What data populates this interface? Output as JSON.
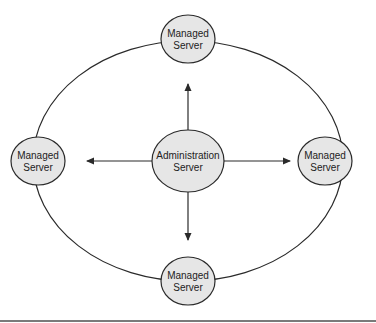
{
  "diagram": {
    "type": "hub-and-ring server topology",
    "colors": {
      "stroke": "#2a2a2a",
      "node_fill": "#e6e6e6",
      "background": "#ffffff",
      "rule": "#7a7a7a"
    },
    "ring": {
      "cx": 188,
      "cy": 161,
      "rx": 155,
      "ry": 120
    },
    "center_node": {
      "id": "admin",
      "line1": "Administration",
      "line2": "Server",
      "cx": 188,
      "cy": 161,
      "rx": 36,
      "ry": 31
    },
    "nodes": [
      {
        "id": "top",
        "line1": "Managed",
        "line2": "Server",
        "cx": 188,
        "cy": 39,
        "rx": 27,
        "ry": 24
      },
      {
        "id": "left",
        "line1": "Managed",
        "line2": "Server",
        "cx": 38,
        "cy": 161,
        "rx": 27,
        "ry": 24
      },
      {
        "id": "right",
        "line1": "Managed",
        "line2": "Server",
        "cx": 325,
        "cy": 161,
        "rx": 27,
        "ry": 24
      },
      {
        "id": "bottom",
        "line1": "Managed",
        "line2": "Server",
        "cx": 188,
        "cy": 281,
        "rx": 27,
        "ry": 24
      }
    ],
    "arrows": [
      {
        "from": "admin",
        "to": "top",
        "x1": 188,
        "y1": 130,
        "x2": 188,
        "y2": 84
      },
      {
        "from": "admin",
        "to": "left",
        "x1": 152,
        "y1": 161,
        "x2": 87,
        "y2": 161
      },
      {
        "from": "admin",
        "to": "right",
        "x1": 224,
        "y1": 161,
        "x2": 290,
        "y2": 161
      },
      {
        "from": "admin",
        "to": "bottom",
        "x1": 188,
        "y1": 192,
        "x2": 188,
        "y2": 240
      }
    ]
  }
}
